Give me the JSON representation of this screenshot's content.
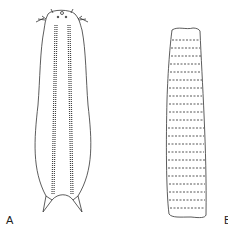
{
  "figure": {
    "panels": [
      {
        "id": "A",
        "label": "A",
        "subject": "elongated flatworm-like organism with head tentacles and two ventral stripes of dashes, forked tail"
      },
      {
        "id": "B",
        "label": "B",
        "subject": "cylindrical segmented organism with transverse dashed bands"
      }
    ]
  },
  "colors": {
    "line": "#333333",
    "background": "#ffffff"
  }
}
